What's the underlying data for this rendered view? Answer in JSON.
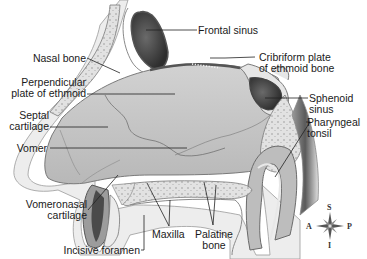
{
  "diagram": {
    "labels": {
      "frontal_sinus": "Frontal sinus",
      "cribriform_line1": "Cribriform plate",
      "cribriform_line2": "of ethmoid bone",
      "nasal_bone": "Nasal bone",
      "perpendicular_line1": "Perpendicular",
      "perpendicular_line2": "plate of ethmoid",
      "septal_line1": "Septal",
      "septal_line2": "cartilage",
      "vomer": "Vomer",
      "sphenoid_line1": "Sphenoid",
      "sphenoid_line2": "sinus",
      "pharyngeal_line1": "Pharyngeal",
      "pharyngeal_line2": "tonsil",
      "vomeronasal_line1": "Vomeronasal",
      "vomeronasal_line2": "cartilage",
      "maxilla": "Maxilla",
      "palatine_line1": "Palatine",
      "palatine_line2": "bone",
      "incisive_foramen": "Incisive foramen"
    },
    "compass": {
      "superior": "S",
      "inferior": "I",
      "anterior": "A",
      "posterior": "P"
    },
    "colors": {
      "bone": "#d9d9d9",
      "cavity": "#c4c4c4",
      "sinus": "#4a4a4a",
      "outline": "#6b6b6b",
      "leader": "#222222"
    }
  }
}
